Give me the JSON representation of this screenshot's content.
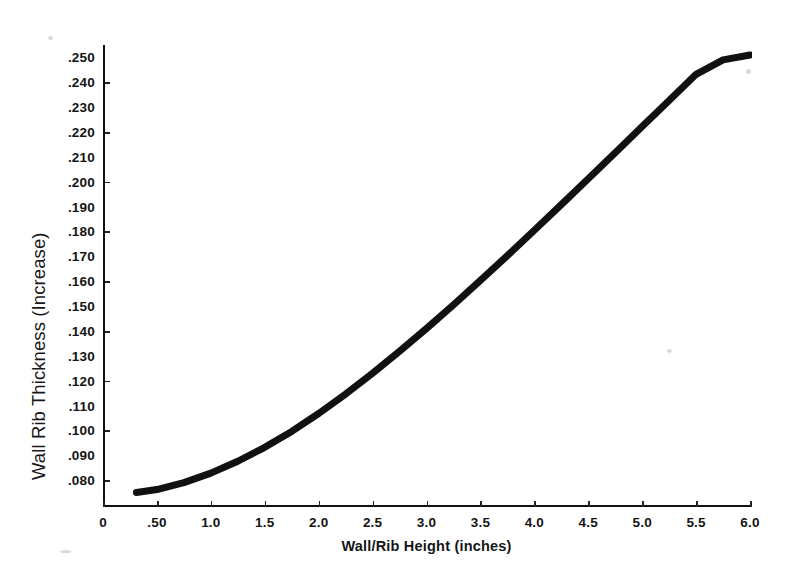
{
  "chart_data": {
    "type": "line",
    "title": "",
    "xlabel": "Wall/Rib Height (inches)",
    "ylabel": "Wall Rib Thickness (Increase)",
    "xlim": [
      0,
      6.0
    ],
    "ylim": [
      0.07,
      0.255
    ],
    "grid": false,
    "legend": "none",
    "line_color": "#111111",
    "line_width_px": 7,
    "xticks": [
      {
        "value": 0,
        "label": "0"
      },
      {
        "value": 0.5,
        "label": ".50"
      },
      {
        "value": 1.0,
        "label": "1.0"
      },
      {
        "value": 1.5,
        "label": "1.5"
      },
      {
        "value": 2.0,
        "label": "2.0"
      },
      {
        "value": 2.5,
        "label": "2.5"
      },
      {
        "value": 3.0,
        "label": "3.0"
      },
      {
        "value": 3.5,
        "label": "3.5"
      },
      {
        "value": 4.0,
        "label": "4.0"
      },
      {
        "value": 4.5,
        "label": "4.5"
      },
      {
        "value": 5.0,
        "label": "5.0"
      },
      {
        "value": 5.5,
        "label": "5.5"
      },
      {
        "value": 6.0,
        "label": "6.0"
      }
    ],
    "yticks": [
      {
        "value": 0.25,
        "label": ".250"
      },
      {
        "value": 0.24,
        "label": ".240"
      },
      {
        "value": 0.23,
        "label": ".230"
      },
      {
        "value": 0.22,
        "label": ".220"
      },
      {
        "value": 0.21,
        "label": ".210"
      },
      {
        "value": 0.2,
        "label": ".200"
      },
      {
        "value": 0.19,
        "label": ".190"
      },
      {
        "value": 0.18,
        "label": ".180"
      },
      {
        "value": 0.17,
        "label": ".170"
      },
      {
        "value": 0.16,
        "label": ".160"
      },
      {
        "value": 0.15,
        "label": ".150"
      },
      {
        "value": 0.14,
        "label": ".140"
      },
      {
        "value": 0.13,
        "label": ".130"
      },
      {
        "value": 0.12,
        "label": ".120"
      },
      {
        "value": 0.11,
        "label": ".110"
      },
      {
        "value": 0.1,
        "label": ".100"
      },
      {
        "value": 0.09,
        "label": ".090"
      },
      {
        "value": 0.08,
        "label": ".080"
      }
    ],
    "series": [
      {
        "name": "Wall Rib Thickness Increase",
        "x": [
          0.31,
          0.5,
          0.75,
          1.0,
          1.25,
          1.5,
          1.75,
          2.0,
          2.25,
          2.5,
          2.75,
          3.0,
          3.25,
          3.5,
          3.75,
          4.0,
          4.25,
          4.5,
          4.75,
          5.0,
          5.25,
          5.5,
          5.75,
          6.0
        ],
        "y": [
          0.075,
          0.0762,
          0.079,
          0.0828,
          0.0876,
          0.0932,
          0.0996,
          0.1068,
          0.1146,
          0.123,
          0.1318,
          0.141,
          0.1505,
          0.1603,
          0.1703,
          0.1805,
          0.1908,
          0.2012,
          0.2117,
          0.2222,
          0.2327,
          0.2432,
          0.249,
          0.251
        ]
      }
    ]
  }
}
